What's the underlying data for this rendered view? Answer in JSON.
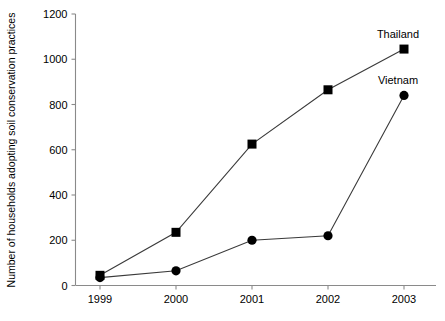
{
  "chart_data": {
    "type": "line",
    "title": "",
    "xlabel": "",
    "ylabel": "Number of households adopting soil conservation practices",
    "categories": [
      "1999",
      "2000",
      "2001",
      "2002",
      "2003"
    ],
    "x": [
      1999,
      2000,
      2001,
      2002,
      2003
    ],
    "ylim": [
      0,
      1200
    ],
    "yticks": [
      0,
      200,
      400,
      600,
      800,
      1000,
      1200
    ],
    "ytick_labels": [
      "0",
      "200",
      "400",
      "600",
      "800",
      "1000",
      "1200"
    ],
    "grid": false,
    "legend_position": "inline-end-of-line",
    "series": [
      {
        "name": "Thailand",
        "marker": "square",
        "color": "#000000",
        "values": [
          45,
          235,
          625,
          865,
          1045
        ]
      },
      {
        "name": "Vietnam",
        "marker": "circle",
        "color": "#000000",
        "values": [
          35,
          65,
          200,
          220,
          840
        ]
      }
    ]
  },
  "labels": {
    "series_thailand": "Thailand",
    "series_vietnam": "Vietnam"
  }
}
